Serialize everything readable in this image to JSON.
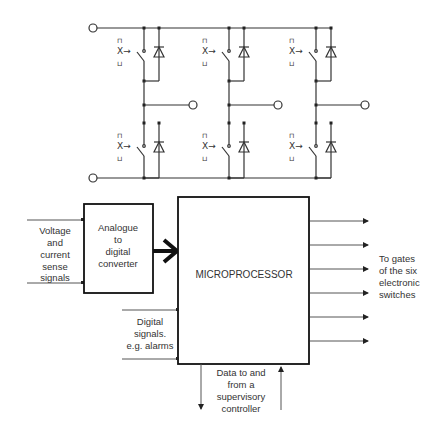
{
  "inverter": {
    "legs": [
      {
        "name": "leg-1"
      },
      {
        "name": "leg-2"
      },
      {
        "name": "leg-3"
      }
    ],
    "gate_glyph": "X→",
    "gate_top": "⊓",
    "gate_bottom": "⊔"
  },
  "blocks": {
    "adc": {
      "lines": [
        "Analogue",
        "to",
        "digital",
        "converter"
      ]
    },
    "microprocessor": {
      "label": "MICROPROCESSOR"
    }
  },
  "labels": {
    "sense": [
      "Voltage",
      "and",
      "current",
      "sense",
      "signals"
    ],
    "digital": [
      "Digital",
      "signals.",
      "e.g. alarms"
    ],
    "supervisory": [
      "Data to and",
      "from a",
      "supervisory",
      "controller"
    ],
    "gates": [
      "To gates",
      "of the six",
      "electronic",
      "switches"
    ]
  },
  "outputs": {
    "count": 6
  }
}
